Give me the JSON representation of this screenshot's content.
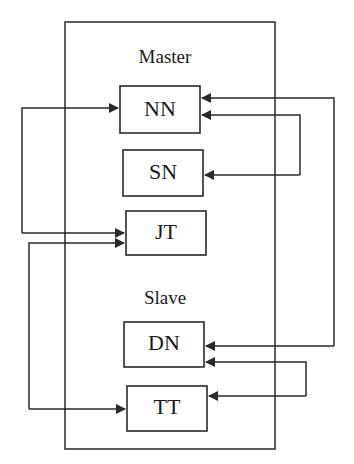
{
  "diagram": {
    "colors": {
      "stroke": "#2a2a2a",
      "text": "#1a1a1a",
      "background": "#ffffff"
    },
    "groups": [
      {
        "id": "master",
        "label": "Master"
      },
      {
        "id": "slave",
        "label": "Slave"
      }
    ],
    "nodes": [
      {
        "id": "NN",
        "label": "NN",
        "group": "master"
      },
      {
        "id": "SN",
        "label": "SN",
        "group": "master"
      },
      {
        "id": "JT",
        "label": "JT",
        "group": "master"
      },
      {
        "id": "DN",
        "label": "DN",
        "group": "slave"
      },
      {
        "id": "TT",
        "label": "TT",
        "group": "slave"
      }
    ],
    "edges": [
      {
        "from": "JT",
        "to": "NN",
        "side": "left",
        "bidirectional": true
      },
      {
        "from": "TT",
        "to": "JT",
        "side": "left",
        "bidirectional": true
      },
      {
        "from": "DN",
        "to": "NN",
        "side": "right",
        "bidirectional": true
      },
      {
        "from": "SN",
        "to": "NN",
        "side": "right",
        "bidirectional": true
      },
      {
        "from": "TT",
        "to": "DN",
        "side": "right",
        "bidirectional": true
      }
    ]
  }
}
